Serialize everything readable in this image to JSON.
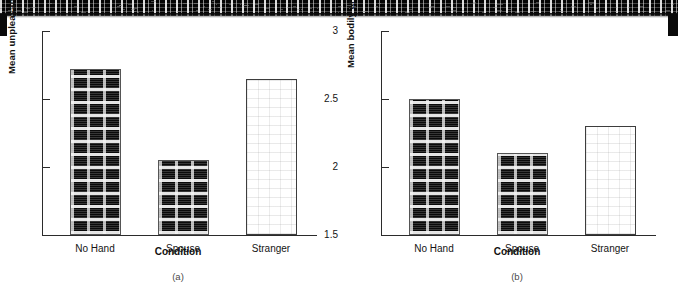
{
  "figure": {
    "background_color": "#ffffff",
    "ink_color": "#141414",
    "bar_dark_color": "#0a0a0a",
    "bar_light_color": "#ffffff"
  },
  "axis": {
    "tick_labels": [
      "3",
      "2.5",
      "2",
      "1.5"
    ],
    "tick_values": [
      3,
      2.5,
      2,
      1.5
    ],
    "xlabel": "Condition",
    "categories": [
      "No Hand",
      "Spouse",
      "Stranger"
    ]
  },
  "panels": [
    {
      "caption": "(a)",
      "ylabel": "Mean unpleasantness rating",
      "values": [
        2.72,
        2.05,
        2.65
      ]
    },
    {
      "caption": "(b)",
      "ylabel": "Mean bodily arousal",
      "values": [
        2.5,
        2.1,
        2.3
      ]
    }
  ],
  "chart_data": [
    {
      "type": "bar",
      "title": "(a)",
      "categories": [
        "No Hand",
        "Spouse",
        "Stranger"
      ],
      "values": [
        2.72,
        2.05,
        2.65
      ],
      "xlabel": "Condition",
      "ylabel": "Mean unpleasantness rating",
      "ylim": [
        1.5,
        3
      ],
      "yticks": [
        1.5,
        2,
        2.5,
        3
      ],
      "grid": false,
      "legend": "none",
      "bar_styles": [
        "dark-hatched",
        "dark-hatched",
        "light-stippled"
      ]
    },
    {
      "type": "bar",
      "title": "(b)",
      "categories": [
        "No Hand",
        "Spouse",
        "Stranger"
      ],
      "values": [
        2.5,
        2.1,
        2.3
      ],
      "xlabel": "Condition",
      "ylabel": "Mean bodily arousal",
      "ylim": [
        1.5,
        3
      ],
      "yticks": [
        1.5,
        2,
        2.5,
        3
      ],
      "grid": false,
      "legend": "none",
      "bar_styles": [
        "dark-hatched",
        "dark-hatched",
        "light-stippled"
      ]
    }
  ]
}
